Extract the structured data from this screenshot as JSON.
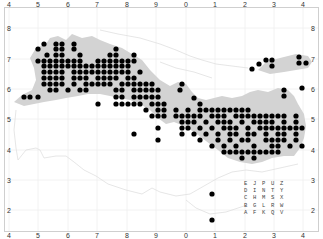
{
  "map": {
    "background": "#ffffff",
    "land_shaded_color": "#d3d3d3",
    "boundary_color": "#e2e2e2",
    "grid_color": "#efefef",
    "dot_color": "#000000",
    "frame_color": "#cfcfcf"
  },
  "axes": {
    "top": [
      {
        "label": "4",
        "x": 9
      },
      {
        "label": "5",
        "x": 38
      },
      {
        "label": "6",
        "x": 68
      },
      {
        "label": "7",
        "x": 97
      },
      {
        "label": "8",
        "x": 127
      },
      {
        "label": "9",
        "x": 156
      },
      {
        "label": "0",
        "x": 186
      },
      {
        "label": "1",
        "x": 215
      },
      {
        "label": "2",
        "x": 245
      },
      {
        "label": "3",
        "x": 274
      },
      {
        "label": "4",
        "x": 303
      }
    ],
    "bottom": [
      {
        "label": "4",
        "x": 9
      },
      {
        "label": "5",
        "x": 38
      },
      {
        "label": "6",
        "x": 68
      },
      {
        "label": "7",
        "x": 97
      },
      {
        "label": "8",
        "x": 127
      },
      {
        "label": "9",
        "x": 156
      },
      {
        "label": "0",
        "x": 186
      },
      {
        "label": "1",
        "x": 215
      },
      {
        "label": "2",
        "x": 245
      },
      {
        "label": "3",
        "x": 274
      },
      {
        "label": "4",
        "x": 303
      }
    ],
    "left": [
      {
        "label": "8",
        "y": 28
      },
      {
        "label": "7",
        "y": 59
      },
      {
        "label": "6",
        "y": 89
      },
      {
        "label": "5",
        "y": 119
      },
      {
        "label": "4",
        "y": 150
      },
      {
        "label": "3",
        "y": 180
      },
      {
        "label": "2",
        "y": 210
      }
    ],
    "right": [
      {
        "label": "8",
        "y": 28
      },
      {
        "label": "7",
        "y": 59
      },
      {
        "label": "6",
        "y": 89
      },
      {
        "label": "5",
        "y": 119
      },
      {
        "label": "4",
        "y": 150
      },
      {
        "label": "3",
        "y": 180
      },
      {
        "label": "2",
        "y": 210
      }
    ]
  },
  "legend": {
    "rows": [
      "E J P U Z",
      "D I N T Y",
      "C H M S X",
      "B G L R W",
      "A F K Q V"
    ]
  },
  "dots": [
    [
      38,
      49
    ],
    [
      44,
      44
    ],
    [
      56,
      44
    ],
    [
      62,
      44
    ],
    [
      56,
      49
    ],
    [
      62,
      49
    ],
    [
      74,
      44
    ],
    [
      74,
      49
    ],
    [
      47,
      55
    ],
    [
      56,
      55
    ],
    [
      80,
      55
    ],
    [
      38,
      61
    ],
    [
      44,
      61
    ],
    [
      50,
      61
    ],
    [
      56,
      61
    ],
    [
      62,
      61
    ],
    [
      68,
      61
    ],
    [
      74,
      61
    ],
    [
      80,
      61
    ],
    [
      62,
      55
    ],
    [
      44,
      66
    ],
    [
      50,
      66
    ],
    [
      56,
      66
    ],
    [
      62,
      66
    ],
    [
      68,
      66
    ],
    [
      74,
      66
    ],
    [
      80,
      66
    ],
    [
      86,
      66
    ],
    [
      92,
      66
    ],
    [
      98,
      66
    ],
    [
      104,
      66
    ],
    [
      110,
      66
    ],
    [
      116,
      66
    ],
    [
      122,
      66
    ],
    [
      128,
      66
    ],
    [
      98,
      61
    ],
    [
      104,
      61
    ],
    [
      110,
      61
    ],
    [
      116,
      61
    ],
    [
      122,
      61
    ],
    [
      128,
      61
    ],
    [
      134,
      61
    ],
    [
      110,
      55
    ],
    [
      116,
      55
    ],
    [
      116,
      49
    ],
    [
      134,
      55
    ],
    [
      44,
      72
    ],
    [
      50,
      72
    ],
    [
      56,
      72
    ],
    [
      62,
      72
    ],
    [
      74,
      72
    ],
    [
      80,
      72
    ],
    [
      86,
      72
    ],
    [
      92,
      72
    ],
    [
      98,
      72
    ],
    [
      104,
      72
    ],
    [
      110,
      72
    ],
    [
      116,
      72
    ],
    [
      122,
      72
    ],
    [
      128,
      72
    ],
    [
      140,
      72
    ],
    [
      44,
      78
    ],
    [
      50,
      78
    ],
    [
      56,
      78
    ],
    [
      62,
      78
    ],
    [
      74,
      78
    ],
    [
      80,
      78
    ],
    [
      86,
      78
    ],
    [
      98,
      78
    ],
    [
      104,
      78
    ],
    [
      110,
      78
    ],
    [
      116,
      78
    ],
    [
      128,
      78
    ],
    [
      134,
      78
    ],
    [
      44,
      84
    ],
    [
      50,
      84
    ],
    [
      56,
      84
    ],
    [
      62,
      84
    ],
    [
      74,
      84
    ],
    [
      86,
      84
    ],
    [
      92,
      84
    ],
    [
      98,
      84
    ],
    [
      104,
      84
    ],
    [
      110,
      84
    ],
    [
      122,
      84
    ],
    [
      128,
      84
    ],
    [
      134,
      84
    ],
    [
      140,
      84
    ],
    [
      146,
      84
    ],
    [
      152,
      84
    ],
    [
      50,
      90
    ],
    [
      56,
      90
    ],
    [
      68,
      90
    ],
    [
      80,
      90
    ],
    [
      86,
      90
    ],
    [
      116,
      90
    ],
    [
      122,
      90
    ],
    [
      134,
      90
    ],
    [
      140,
      90
    ],
    [
      146,
      90
    ],
    [
      152,
      90
    ],
    [
      158,
      90
    ],
    [
      24,
      97
    ],
    [
      30,
      97
    ],
    [
      38,
      97
    ],
    [
      116,
      97
    ],
    [
      122,
      97
    ],
    [
      134,
      97
    ],
    [
      140,
      97
    ],
    [
      146,
      97
    ],
    [
      152,
      97
    ],
    [
      158,
      97
    ],
    [
      180,
      90
    ],
    [
      182,
      84
    ],
    [
      194,
      98
    ],
    [
      98,
      104
    ],
    [
      116,
      104
    ],
    [
      122,
      104
    ],
    [
      128,
      104
    ],
    [
      134,
      104
    ],
    [
      140,
      104
    ],
    [
      152,
      104
    ],
    [
      158,
      104
    ],
    [
      164,
      104
    ],
    [
      146,
      110
    ],
    [
      158,
      110
    ],
    [
      164,
      110
    ],
    [
      176,
      110
    ],
    [
      188,
      110
    ],
    [
      200,
      104
    ],
    [
      200,
      110
    ],
    [
      206,
      110
    ],
    [
      212,
      110
    ],
    [
      218,
      110
    ],
    [
      224,
      110
    ],
    [
      230,
      110
    ],
    [
      236,
      110
    ],
    [
      242,
      110
    ],
    [
      248,
      110
    ],
    [
      152,
      116
    ],
    [
      158,
      116
    ],
    [
      164,
      116
    ],
    [
      176,
      116
    ],
    [
      182,
      116
    ],
    [
      188,
      116
    ],
    [
      194,
      116
    ],
    [
      200,
      116
    ],
    [
      212,
      116
    ],
    [
      218,
      116
    ],
    [
      224,
      116
    ],
    [
      236,
      116
    ],
    [
      242,
      116
    ],
    [
      248,
      116
    ],
    [
      254,
      116
    ],
    [
      260,
      116
    ],
    [
      266,
      116
    ],
    [
      272,
      116
    ],
    [
      278,
      116
    ],
    [
      284,
      116
    ],
    [
      296,
      116
    ],
    [
      182,
      122
    ],
    [
      188,
      122
    ],
    [
      194,
      122
    ],
    [
      206,
      122
    ],
    [
      218,
      122
    ],
    [
      224,
      122
    ],
    [
      230,
      122
    ],
    [
      242,
      122
    ],
    [
      254,
      122
    ],
    [
      260,
      122
    ],
    [
      266,
      122
    ],
    [
      272,
      122
    ],
    [
      284,
      122
    ],
    [
      296,
      122
    ],
    [
      158,
      128
    ],
    [
      182,
      128
    ],
    [
      188,
      128
    ],
    [
      200,
      128
    ],
    [
      212,
      128
    ],
    [
      224,
      128
    ],
    [
      230,
      128
    ],
    [
      236,
      128
    ],
    [
      248,
      128
    ],
    [
      260,
      128
    ],
    [
      266,
      128
    ],
    [
      272,
      128
    ],
    [
      278,
      128
    ],
    [
      284,
      128
    ],
    [
      290,
      128
    ],
    [
      296,
      128
    ],
    [
      134,
      134
    ],
    [
      182,
      134
    ],
    [
      194,
      134
    ],
    [
      206,
      134
    ],
    [
      218,
      134
    ],
    [
      230,
      134
    ],
    [
      236,
      134
    ],
    [
      248,
      134
    ],
    [
      254,
      134
    ],
    [
      266,
      134
    ],
    [
      278,
      134
    ],
    [
      284,
      134
    ],
    [
      296,
      134
    ],
    [
      302,
      128
    ],
    [
      158,
      140
    ],
    [
      200,
      140
    ],
    [
      218,
      140
    ],
    [
      230,
      140
    ],
    [
      242,
      140
    ],
    [
      248,
      140
    ],
    [
      266,
      140
    ],
    [
      272,
      140
    ],
    [
      278,
      140
    ],
    [
      284,
      140
    ],
    [
      296,
      140
    ],
    [
      212,
      146
    ],
    [
      224,
      146
    ],
    [
      236,
      146
    ],
    [
      254,
      146
    ],
    [
      272,
      146
    ],
    [
      278,
      146
    ],
    [
      290,
      146
    ],
    [
      302,
      146
    ],
    [
      224,
      152
    ],
    [
      230,
      152
    ],
    [
      236,
      152
    ],
    [
      242,
      152
    ],
    [
      248,
      152
    ],
    [
      254,
      152
    ],
    [
      260,
      152
    ],
    [
      266,
      152
    ],
    [
      272,
      152
    ],
    [
      278,
      152
    ],
    [
      242,
      158
    ],
    [
      254,
      158
    ],
    [
      284,
      90
    ],
    [
      284,
      96
    ],
    [
      302,
      88
    ],
    [
      252,
      69
    ],
    [
      259,
      64
    ],
    [
      266,
      60
    ],
    [
      272,
      60
    ],
    [
      272,
      66
    ],
    [
      299,
      57
    ],
    [
      299,
      63
    ],
    [
      306,
      63
    ],
    [
      212,
      194
    ],
    [
      212,
      220
    ]
  ]
}
